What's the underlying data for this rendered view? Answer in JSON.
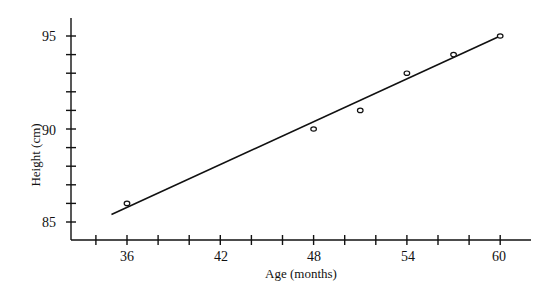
{
  "chart_data": {
    "type": "scatter",
    "title": "",
    "xlabel": "Age (months)",
    "ylabel": "Height (cm)",
    "xlim": [
      32,
      62
    ],
    "ylim": [
      84,
      95.5
    ],
    "x_ticks": [
      36,
      42,
      48,
      54,
      60
    ],
    "x_minor_step": 2,
    "y_ticks": [
      85,
      90,
      95
    ],
    "y_minor_step": 1,
    "grid": false,
    "legend": null,
    "series": [
      {
        "name": "observations",
        "kind": "scatter",
        "marker": "open-circle",
        "x": [
          36,
          48,
          51,
          54,
          57,
          60
        ],
        "y": [
          86,
          90,
          91,
          93,
          94,
          95
        ]
      },
      {
        "name": "fitted line",
        "kind": "line",
        "x": [
          35,
          60
        ],
        "y": [
          85.4,
          95
        ]
      }
    ]
  },
  "labels": {
    "x_axis_title": "Age (months)",
    "y_axis_title": "Height (cm)",
    "x_tick_labels": [
      "36",
      "42",
      "48",
      "54",
      "60"
    ],
    "y_tick_labels": [
      "95",
      "90",
      "85"
    ]
  }
}
